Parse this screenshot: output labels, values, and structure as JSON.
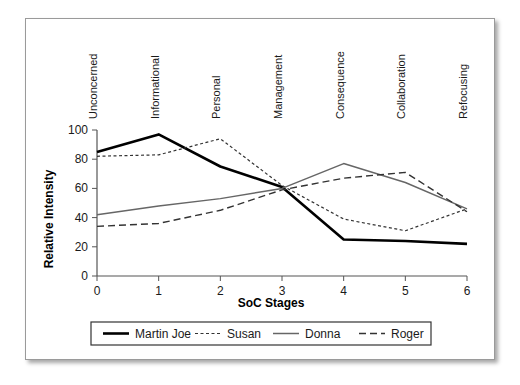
{
  "chart_data": {
    "type": "line",
    "title": "",
    "xlabel": "SoC Stages",
    "ylabel": "Relative Intensity",
    "x": [
      0,
      1,
      2,
      3,
      4,
      5,
      6
    ],
    "xticklabels": [
      "0",
      "1",
      "2",
      "3",
      "4",
      "5",
      "6"
    ],
    "yticklabels": [
      "0",
      "20",
      "40",
      "60",
      "80",
      "100"
    ],
    "yticks": [
      0,
      20,
      40,
      60,
      80,
      100
    ],
    "xlim": [
      0,
      6
    ],
    "ylim": [
      0,
      100
    ],
    "grid": false,
    "legend_position": "bottom",
    "stage_labels": [
      "Unconcerned",
      "Informational",
      "Personal",
      "Management",
      "Consequence",
      "Collaboration",
      "Refocusing"
    ],
    "series": [
      {
        "name": "Martin Joe",
        "style": "solid-thick",
        "color": "#000000",
        "values": [
          85,
          97,
          75,
          61,
          25,
          24,
          22
        ]
      },
      {
        "name": "Susan",
        "style": "dotted",
        "color": "#333333",
        "values": [
          82,
          83,
          94,
          62,
          39,
          31,
          46
        ]
      },
      {
        "name": "Donna",
        "style": "solid-thin",
        "color": "#666666",
        "values": [
          42,
          48,
          53,
          60,
          77,
          64,
          46
        ]
      },
      {
        "name": "Roger",
        "style": "dashed",
        "color": "#333333",
        "values": [
          34,
          36,
          45,
          59,
          67,
          71,
          44
        ]
      }
    ]
  }
}
